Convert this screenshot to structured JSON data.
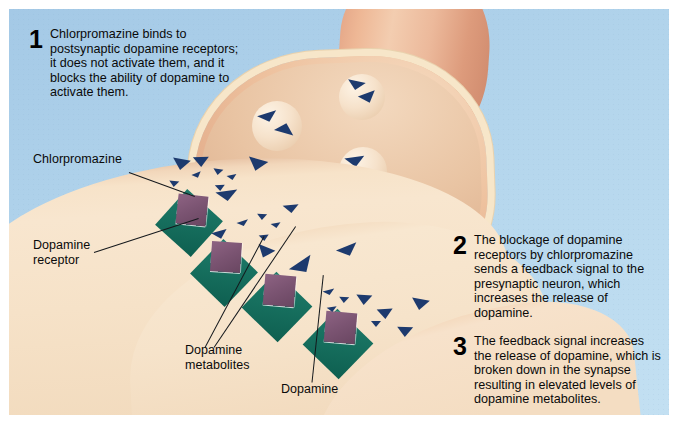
{
  "figure": {
    "background_color": "#b3d5ec",
    "frame_color": "#ffffff"
  },
  "colors": {
    "background_blue": "#b3d5ec",
    "postsynaptic_tan": "#f7e3c9",
    "presynaptic_peach": "#eec29f",
    "membrane_cream": "#f7e6c9",
    "dopamine_navy": "#1d3a6e",
    "receptor_teal": "#17705f",
    "chlorpromazine_purple": "#7b5472",
    "text_black": "#0a0a0a"
  },
  "steps": [
    {
      "number": "1",
      "text": "Chlorpromazine binds to\npostsynaptic dopamine receptors;\nit does not activate them, and it\nblocks the ability of dopamine to\nactivate them."
    },
    {
      "number": "2",
      "text": "The blockage of dopamine\nreceptors by chlorpromazine\nsends a feedback signal to the\npresynaptic neuron, which\nincreases the release of\ndopamine."
    },
    {
      "number": "3",
      "text": "The feedback signal increases\nthe release of dopamine, which is\nbroken down in the synapse\nresulting in elevated levels of\ndopamine metabolites."
    }
  ],
  "callouts": [
    {
      "id": "chlorpromazine",
      "text": "Chlorpromazine"
    },
    {
      "id": "dopamine-receptor",
      "text": "Dopamine\nreceptor"
    },
    {
      "id": "dopamine-metabolites",
      "text": "Dopamine\nmetabolites"
    },
    {
      "id": "dopamine",
      "text": "Dopamine"
    }
  ],
  "structures": {
    "presynaptic_neuron": "presynaptic-terminal",
    "postsynaptic_neuron": "postsynaptic-membrane",
    "synaptic_cleft": "synaptic-cleft",
    "vesicle_count": 6,
    "receptor_count": 4
  }
}
